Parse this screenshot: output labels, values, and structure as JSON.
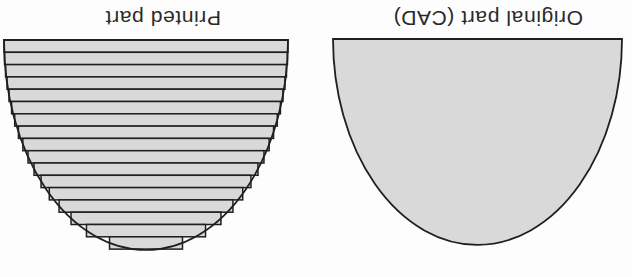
{
  "diagram": {
    "type": "diagram",
    "background": "#fdfdfd",
    "ink_color": "#1f1f1f",
    "shape_fill": "#d9d9d9",
    "orientation_note": "entire figure rotated 180 degrees (labels appear upside-down at top)",
    "panels": {
      "printed": {
        "label": "Printed part",
        "style": "layered",
        "layers": 17,
        "geometry": {
          "cx": 146,
          "top": 40,
          "half_width": 142,
          "height": 210,
          "layer_height": 12.3
        }
      },
      "original": {
        "label": "Original part (CAD)",
        "style": "smooth",
        "geometry": {
          "cx": 477.5,
          "top": 39,
          "half_width": 144.5,
          "height": 206
        }
      }
    }
  }
}
